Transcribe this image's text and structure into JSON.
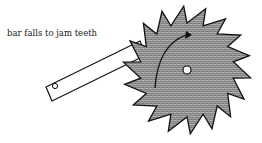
{
  "diagram": {
    "type": "ratchet mechanism",
    "label": "bar falls to jam teeth",
    "components": [
      {
        "name": "ratchet-wheel",
        "teeth": 18
      },
      {
        "name": "pawl-bar"
      },
      {
        "name": "rotation-arrow",
        "direction": "clockwise"
      }
    ],
    "colors": {
      "line": "#111111",
      "fill": "#9a9a9a",
      "background": "#ffffff"
    }
  }
}
